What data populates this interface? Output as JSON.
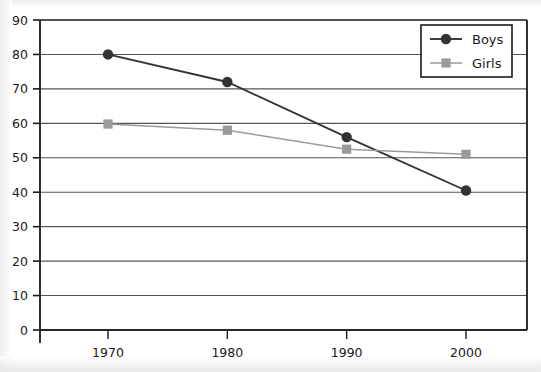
{
  "chart_data": {
    "type": "line",
    "title": "",
    "xlabel": "",
    "ylabel": "",
    "categories": [
      "1970",
      "1980",
      "1990",
      "2000"
    ],
    "x": [
      1970,
      1980,
      1990,
      2000
    ],
    "xlim": [
      1964,
      2006
    ],
    "ylim": [
      0,
      90
    ],
    "ytick_values": [
      0,
      10,
      20,
      30,
      40,
      50,
      60,
      70,
      80,
      90
    ],
    "ytick_labels": [
      "0",
      "10",
      "20",
      "30",
      "40",
      "50",
      "60",
      "70",
      "80",
      "90"
    ],
    "xtick_labels": [
      "1970",
      "1980",
      "1990",
      "2000"
    ],
    "grid": "horizontal",
    "legend_position": "top-right",
    "series": [
      {
        "name": "Boys",
        "marker": "circle",
        "color": "#333333",
        "values": [
          80,
          72,
          56,
          40.5
        ]
      },
      {
        "name": "Girls",
        "marker": "square",
        "color": "#9a9a9a",
        "values": [
          59.8,
          58,
          52.5,
          51
        ]
      }
    ]
  },
  "legend": {
    "entries": [
      {
        "label": "Boys"
      },
      {
        "label": "Girls"
      }
    ]
  },
  "colors": {
    "boys": "#333333",
    "girls": "#9a9a9a",
    "axis": "#1a1a1a",
    "grid": "#555555",
    "background": "#ffffff"
  }
}
